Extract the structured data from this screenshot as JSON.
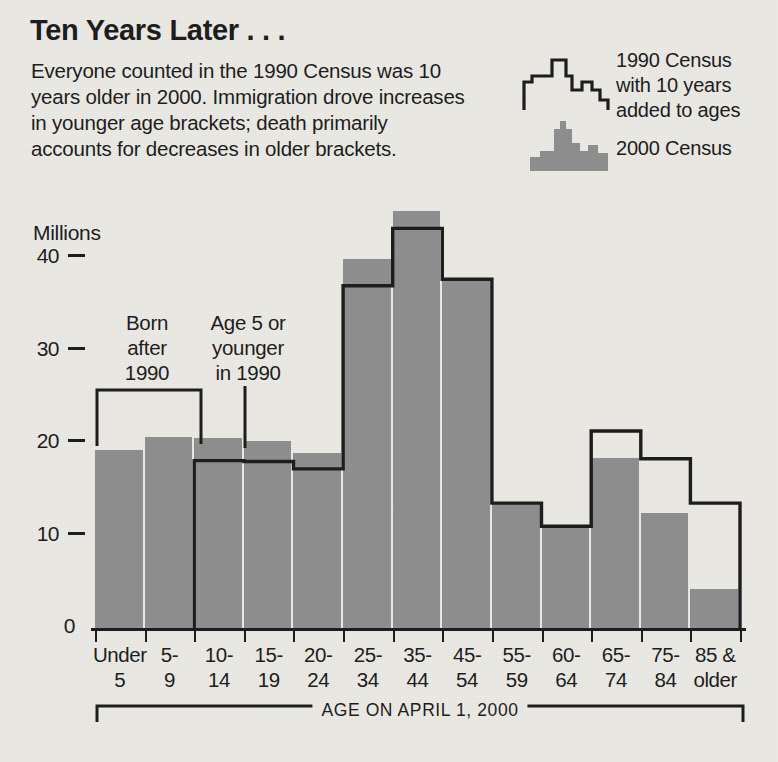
{
  "header": {
    "title": "Ten Years Later . . .",
    "blurb_lines": [
      "Everyone counted in the 1990 Census was 10",
      "years older in 2000. Immigration drove increases",
      "in younger age brackets; death primarily",
      "accounts for decreases in older brackets."
    ]
  },
  "legend": {
    "series_1990_lines": [
      "1990 Census",
      "with 10 years",
      "added to ages"
    ],
    "series_2000_label": "2000 Census",
    "swatch_1990_icon": "skyline-outline-icon",
    "swatch_2000_icon": "skyline-filled-icon"
  },
  "annotations": [
    {
      "lines": [
        "Born",
        "after",
        "1990"
      ]
    },
    {
      "lines": [
        "Age 5 or",
        "younger",
        "in 1990"
      ]
    }
  ],
  "axis": {
    "y_unit_label": "Millions",
    "y_ticks": [
      "40",
      "30",
      "20",
      "10",
      "0"
    ],
    "x_caption": "AGE ON APRIL 1, 2000"
  },
  "colors": {
    "paper": "#eceae5",
    "bar_fill": "#8e8e8e",
    "ink": "#1a1a1a"
  },
  "chart_data": {
    "type": "bar",
    "title": "Ten Years Later . . .",
    "xlabel": "AGE ON APRIL 1, 2000",
    "ylabel": "Millions",
    "ylim": [
      0,
      40
    ],
    "yticks": [
      0,
      10,
      20,
      30,
      40
    ],
    "grid": false,
    "legend_position": "top-right",
    "categories": [
      [
        "Under",
        "5"
      ],
      [
        "5-",
        "9"
      ],
      [
        "10-",
        "14"
      ],
      [
        "15-",
        "19"
      ],
      [
        "20-",
        "24"
      ],
      [
        "25-",
        "34"
      ],
      [
        "35-",
        "44"
      ],
      [
        "45-",
        "54"
      ],
      [
        "55-",
        "59"
      ],
      [
        "60-",
        "64"
      ],
      [
        "65-",
        "74"
      ],
      [
        "75-",
        "84"
      ],
      [
        "85 &",
        "older"
      ]
    ],
    "category_labels": [
      "Under 5",
      "5-9",
      "10-14",
      "15-19",
      "20-24",
      "25-34",
      "35-44",
      "45-54",
      "55-59",
      "60-64",
      "65-74",
      "75-84",
      "85 & older"
    ],
    "series": [
      {
        "name": "2000 Census",
        "style": "filled-bar",
        "values": [
          19.2,
          20.6,
          20.5,
          20.2,
          18.9,
          39.9,
          45.1,
          37.7,
          13.5,
          10.8,
          18.4,
          12.4,
          4.2
        ]
      },
      {
        "name": "1990 Census with 10 years added to ages",
        "style": "step-outline",
        "values": [
          null,
          null,
          18.1,
          18.0,
          17.2,
          37.0,
          43.2,
          37.7,
          13.5,
          11.0,
          21.3,
          18.3,
          13.5
        ]
      }
    ]
  }
}
